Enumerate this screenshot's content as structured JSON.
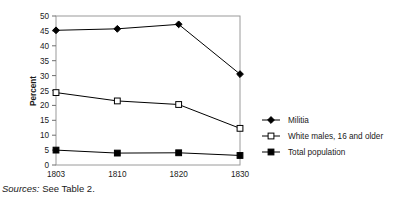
{
  "figure": {
    "source_note_prefix": "Sources:",
    "source_note_text": " See Table 2."
  },
  "chart_data": {
    "type": "line",
    "title": "",
    "xlabel": "",
    "ylabel": "Percent",
    "categories": [
      "1803",
      "1810",
      "1820",
      "1830"
    ],
    "x": [
      1803,
      1810,
      1820,
      1830
    ],
    "xlim": [
      1803,
      1830
    ],
    "ylim": [
      0,
      50
    ],
    "yticks": [
      0,
      5,
      10,
      15,
      20,
      25,
      30,
      35,
      40,
      45,
      50
    ],
    "ytick_labels": [
      "0",
      "5",
      "10",
      "15",
      "20",
      "25",
      "30",
      "35",
      "40",
      "45",
      "50"
    ],
    "grid": false,
    "legend_position": "right",
    "series": [
      {
        "name": "Militia",
        "marker": "filled-diamond",
        "color": "#000000",
        "values": [
          45.2,
          45.7,
          47.2,
          30.5
        ]
      },
      {
        "name": "White males, 16 and older",
        "marker": "open-square",
        "color": "#000000",
        "values": [
          24.3,
          21.5,
          20.3,
          12.3
        ]
      },
      {
        "name": "Total population",
        "marker": "filled-square",
        "color": "#000000",
        "values": [
          5.0,
          4.0,
          4.1,
          3.2
        ]
      }
    ]
  }
}
